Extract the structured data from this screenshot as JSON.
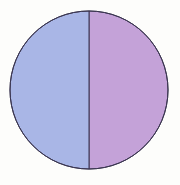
{
  "chart_data": {
    "type": "pie",
    "title": "",
    "categories": [
      "Left half",
      "Right half"
    ],
    "values": [
      50,
      50
    ],
    "colors": [
      "#a9b6e6",
      "#c4a2d8"
    ],
    "start_angle_deg": 90,
    "direction": "clockwise-from-top-right",
    "legend": "none",
    "labels_shown": false
  },
  "style": {
    "background": "#fdfdfb",
    "outline_color": "#3a3550",
    "center": [
      89,
      90
    ],
    "radius": 79
  }
}
